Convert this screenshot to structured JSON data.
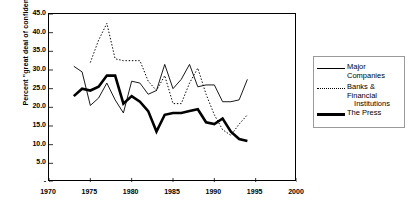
{
  "chart_data": {
    "type": "line",
    "title": "",
    "xlabel": "",
    "ylabel": "Percent \"great deal of confidence\"",
    "xlim": [
      1970,
      2000
    ],
    "ylim": [
      0,
      45
    ],
    "ytick_labels": [
      "45.0",
      "40.0",
      "35.0",
      "30.0",
      "25.0",
      "20.0",
      "15.0",
      "10.0",
      "5.0",
      "-"
    ],
    "ytick_values": [
      45,
      40,
      35,
      30,
      25,
      20,
      15,
      10,
      5,
      0
    ],
    "xtick_labels": [
      "1970",
      "1975",
      "1980",
      "1985",
      "1990",
      "1995",
      "2000"
    ],
    "xtick_values": [
      1970,
      1975,
      1980,
      1985,
      1990,
      1995,
      2000
    ],
    "grid": false,
    "legend_position": "right-outside",
    "series": [
      {
        "name": "Major Companies",
        "style": "solid-thin",
        "x": [
          1973,
          1974,
          1975,
          1976,
          1977,
          1978,
          1979,
          1980,
          1981,
          1982,
          1983,
          1984,
          1985,
          1986,
          1987,
          1988,
          1989,
          1990,
          1991,
          1992,
          1993,
          1994
        ],
        "values": [
          31.0,
          29.5,
          20.5,
          22.5,
          26.5,
          22.0,
          18.5,
          27.0,
          26.5,
          23.5,
          24.5,
          31.5,
          25.0,
          27.5,
          31.5,
          25.5,
          26.0,
          26.0,
          21.5,
          21.5,
          22.0,
          27.5
        ]
      },
      {
        "name": "Banks & Financial Institutions",
        "style": "dotted",
        "x": [
          1975,
          1976,
          1977,
          1978,
          1979,
          1980,
          1981,
          1982,
          1983,
          1984,
          1985,
          1986,
          1987,
          1988,
          1989,
          1990,
          1991,
          1992,
          1993,
          1994
        ],
        "values": [
          32.0,
          38.0,
          42.5,
          33.0,
          32.5,
          32.5,
          32.5,
          27.0,
          24.5,
          28.5,
          21.0,
          21.0,
          26.5,
          30.5,
          23.5,
          18.0,
          14.0,
          12.5,
          15.5,
          18.0
        ]
      },
      {
        "name": "The Press",
        "style": "solid-thick",
        "x": [
          1973,
          1974,
          1975,
          1976,
          1977,
          1978,
          1979,
          1980,
          1981,
          1982,
          1983,
          1984,
          1985,
          1986,
          1987,
          1988,
          1989,
          1990,
          1991,
          1992,
          1993,
          1994
        ],
        "values": [
          23.0,
          25.0,
          24.5,
          25.5,
          28.5,
          28.5,
          21.0,
          23.0,
          21.5,
          19.0,
          13.5,
          18.0,
          18.5,
          18.5,
          19.0,
          19.5,
          16.0,
          15.5,
          17.0,
          13.5,
          11.5,
          11.0
        ]
      }
    ]
  },
  "legend": {
    "items": [
      {
        "label": "Major Companies",
        "label2": ""
      },
      {
        "label": "Banks & Financial",
        "label2": "Institutions"
      },
      {
        "label": "The Press",
        "label2": ""
      }
    ]
  }
}
